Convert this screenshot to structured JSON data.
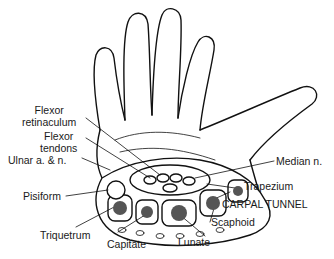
{
  "diagram": {
    "labels": {
      "flexor_retinaculum_1": "Flexor",
      "flexor_retinaculum_2": "retinaculum",
      "flexor_tendons_1": "Flexor",
      "flexor_tendons_2": "tendons",
      "ulnar": "Ulnar a. & n.",
      "pisiform": "Pisiform",
      "triquetrum": "Triquetrum",
      "capitate": "Capitate",
      "lunate": "Lunate",
      "scaphoid": "Scaphoid",
      "carpal_tunnel": "CARPAL TUNNEL",
      "trapezium": "Trapezium",
      "median": "Median n."
    },
    "colors": {
      "line": "#111111",
      "fill": "#ffffff",
      "bone": "#555555"
    }
  }
}
